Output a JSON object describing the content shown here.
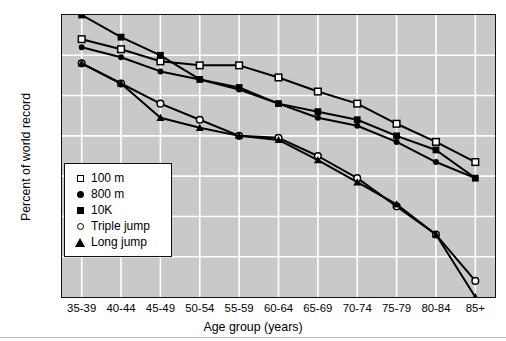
{
  "chart_data": {
    "type": "line",
    "title": "",
    "xlabel": "Age group (years)",
    "ylabel": "Percent of world record",
    "categories": [
      "35-39",
      "40-44",
      "45-49",
      "50-54",
      "55-59",
      "60-64",
      "65-69",
      "70-74",
      "75-79",
      "80-84",
      "85+"
    ],
    "ylim": [
      30,
      100
    ],
    "yticks": [
      30,
      40,
      50,
      60,
      70,
      80,
      90,
      100
    ],
    "grid": true,
    "legend_position": "inside-lower-left",
    "series": [
      {
        "name": "100 m",
        "marker": "open-square",
        "values": [
          94,
          91.5,
          88.5,
          87.5,
          87.5,
          84.5,
          81,
          78,
          73,
          68.5,
          63.5
        ]
      },
      {
        "name": "800 m",
        "marker": "filled-circle",
        "values": [
          92,
          89.5,
          86,
          84,
          81.5,
          78,
          74.5,
          72.5,
          68.5,
          63.5,
          59.5
        ]
      },
      {
        "name": "10K",
        "marker": "filled-square",
        "values": [
          100,
          94.5,
          90,
          84,
          82,
          78,
          76,
          74,
          70,
          66.5,
          59.5
        ]
      },
      {
        "name": "Triple jump",
        "marker": "open-circle",
        "values": [
          88,
          83,
          78,
          74,
          70,
          69.5,
          65,
          59.5,
          52.5,
          45.5,
          34
        ]
      },
      {
        "name": "Long jump",
        "marker": "filled-triangle",
        "values": [
          88,
          83,
          74.5,
          72,
          70,
          69,
          64,
          58.5,
          53,
          45.5,
          30
        ]
      }
    ]
  },
  "axis": {
    "ytick_labels": [
      "100",
      "90",
      "80",
      "70",
      "60",
      "50",
      "40",
      "30"
    ],
    "xtick_labels": [
      "35-39",
      "40-44",
      "45-49",
      "50-54",
      "55-59",
      "60-64",
      "65-69",
      "70-74",
      "75-79",
      "80-84",
      "85+"
    ],
    "xlabel": "Age group (years)",
    "ylabel": "Percent of world record"
  },
  "legend": {
    "items": [
      {
        "label": "100 m",
        "marker": "open-square"
      },
      {
        "label": "800 m",
        "marker": "filled-circle"
      },
      {
        "label": "10K",
        "marker": "filled-square"
      },
      {
        "label": "Triple jump",
        "marker": "open-circle"
      },
      {
        "label": "Long jump",
        "marker": "filled-triangle"
      }
    ]
  },
  "colors": {
    "plot_background": "#c9c9c9",
    "grid": "#ffffff",
    "ink": "#000000",
    "page_background": "#ffffff"
  }
}
